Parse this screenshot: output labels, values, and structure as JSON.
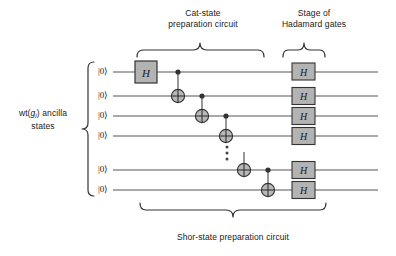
{
  "figure": {
    "title": "Shor-state preparation circuit",
    "background_color": "#ffffff",
    "line_color": "#555555",
    "gate_fill": "#b3b3b3",
    "gate_stroke": "#333333",
    "text_color": "#1a1a1a"
  },
  "captions": {
    "cat_state": "Cat-state\npreparation circuit",
    "cat_state_line1": "Cat-state",
    "cat_state_line2": "preparation circuit",
    "stage_hadamard_line1": "Stage of",
    "stage_hadamard_line2": "Hadamard gates",
    "shor_state": "Shor-state preparation circuit",
    "ancilla_line1_prefix": "wt(",
    "ancilla_line1_var": "g",
    "ancilla_line1_sub": "j",
    "ancilla_line1_suffix": ") ancilla",
    "ancilla_line2": "states"
  },
  "wires": {
    "count": 6,
    "input_label": "|0⟩",
    "labels": [
      "|0⟩",
      "|0⟩",
      "|0⟩",
      "|0⟩",
      "|0⟩",
      "|0⟩"
    ],
    "y_positions": [
      72,
      96,
      116,
      136,
      170,
      190
    ],
    "x_start": 113,
    "x_end": 378
  },
  "gates": {
    "hadamard_label": "H",
    "first_hadamard": {
      "wire": 0,
      "x": 146,
      "label": "H"
    },
    "hadamard_stage": [
      {
        "wire": 0,
        "x": 303,
        "label": "H"
      },
      {
        "wire": 1,
        "x": 303,
        "label": "H"
      },
      {
        "wire": 2,
        "x": 303,
        "label": "H"
      },
      {
        "wire": 3,
        "x": 303,
        "label": "H"
      },
      {
        "wire": 4,
        "x": 303,
        "label": "H"
      },
      {
        "wire": 5,
        "x": 303,
        "label": "H"
      }
    ],
    "cnots": [
      {
        "control_wire": 0,
        "target_wire": 1,
        "x": 178
      },
      {
        "control_wire": 1,
        "target_wire": 2,
        "x": 202
      },
      {
        "control_wire": 2,
        "target_wire": 3,
        "x": 226
      },
      {
        "control_wire": 3,
        "target_wire": 4,
        "x": 244
      },
      {
        "control_wire": 4,
        "target_wire": 5,
        "x": 268
      }
    ],
    "ellipsis": {
      "x": 227,
      "y_positions": [
        147,
        153,
        159
      ],
      "dots": 3
    }
  },
  "braces": {
    "cat_state": {
      "x_left": 137,
      "x_right": 264,
      "y": 50,
      "tip_x": 200
    },
    "stage_hadamard": {
      "x_left": 283,
      "x_right": 325,
      "y": 50,
      "tip_x": 304
    },
    "shor_state": {
      "x_left": 140,
      "x_right": 326,
      "y": 210,
      "tip_x": 233
    },
    "ancilla": {
      "y_top": 62,
      "y_bottom": 196,
      "x": 88,
      "tip_y": 129
    }
  }
}
